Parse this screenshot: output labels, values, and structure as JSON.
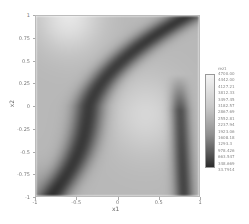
{
  "chart_data": {
    "type": "heatmap",
    "title": "",
    "xlabel": "x1",
    "ylabel": "x2",
    "xlim": [
      -1,
      1
    ],
    "ylim": [
      -1,
      1
    ],
    "x_ticks": [
      "-1",
      "-0.5",
      "0",
      "0.5",
      "1"
    ],
    "y_ticks": [
      "1",
      "0.75",
      "0.5",
      "0.25",
      "0",
      "-0.25",
      "-0.5",
      "-0.75",
      "-1"
    ],
    "colormap": "grayscale (light = high, dark = low)",
    "colorbar": {
      "title": "rez1",
      "labels": [
        "4700.00",
        "4442.00",
        "4127.21",
        "3812.33",
        "3497.45",
        "3182.57",
        "2867.69",
        "2552.81",
        "2237.94",
        "1923.06",
        "1608.18",
        "1293.3",
        "978.426",
        "663.547",
        "348.669",
        "33.7914"
      ],
      "min": 33.7914,
      "max": 4700.0
    },
    "grid": false,
    "legend_position": "right (colorbar)"
  },
  "axes": {
    "xlabel": "x1",
    "ylabel": "x2"
  }
}
